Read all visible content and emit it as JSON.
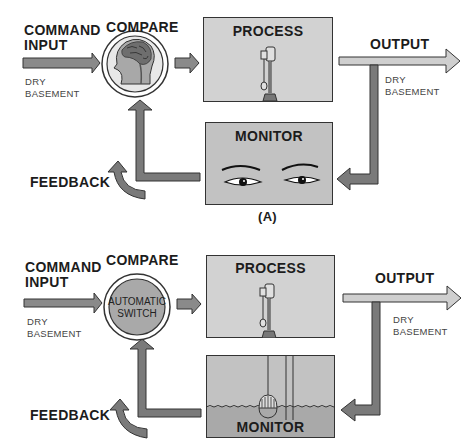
{
  "colors": {
    "arrow_dark": "#777777",
    "arrow_light": "#c9c9c9",
    "box_fill": "#cfcfcf",
    "monitor_fill": "#bdbdbd",
    "water_fill": "#a9a9a9",
    "stroke": "#333333"
  },
  "diagrams": [
    {
      "id": "A",
      "caption": "(A)",
      "command_input": {
        "title_line1": "COMMAND",
        "title_line2": "INPUT",
        "value_line1": "DRY",
        "value_line2": "BASEMENT"
      },
      "compare": {
        "title": "COMPARE",
        "icon": "brain-head-icon"
      },
      "process": {
        "title": "PROCESS",
        "icon": "sump-pump-icon"
      },
      "output": {
        "title": "OUTPUT",
        "value_line1": "DRY",
        "value_line2": "BASEMENT"
      },
      "monitor": {
        "title": "MONITOR",
        "icon": "eyes-icon"
      },
      "feedback": {
        "title": "FEEDBACK"
      }
    },
    {
      "id": "B",
      "command_input": {
        "title_line1": "COMMAND",
        "title_line2": "INPUT",
        "value_line1": "DRY",
        "value_line2": "BASEMENT"
      },
      "compare": {
        "title": "COMPARE",
        "circle_line1": "AUTOMATIC",
        "circle_line2": "SWITCH"
      },
      "process": {
        "title": "PROCESS",
        "icon": "sump-pump-icon"
      },
      "output": {
        "title": "OUTPUT",
        "value_line1": "DRY",
        "value_line2": "BASEMENT"
      },
      "monitor": {
        "title": "MONITOR",
        "icon": "float-in-water-icon"
      },
      "feedback": {
        "title": "FEEDBACK"
      }
    }
  ]
}
